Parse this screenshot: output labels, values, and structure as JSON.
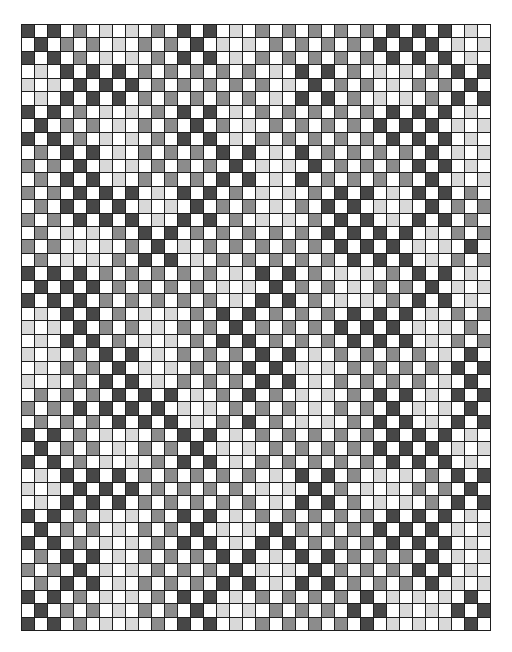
{
  "grid": {
    "columns": 36,
    "rows": 45,
    "palette": {
      "D": "#474747",
      "M": "#8c8c8c",
      "L": "#d9d9d9",
      "W": "#ffffff"
    },
    "border_color": "#1e1e1e",
    "cells": [
      "DWDWMWLWLWMWDWDWLWMWMWMWMWMWDWDWDWLW",
      "WDWMWMWLWMWMWDWLWLWMWMWMWMWDWDWDWLWL",
      "DWDWMWLWLWMWDWDWLWMWMWMWMWMWDWDWDWLW",
      "WLWDWDWDWMWMWMWMWMWLWDWDWMWLWLWMWDWD",
      "LWLWDWDWDWMWMWMWMWMWLWDWMWMWLWMWMWDW",
      "WLWDWDWDWMWMWMWMWMWLWDWDWMWLWLWMWDWD",
      "DWDWMWLWLWMWDWDWLWMWMWMWMWMWDWDWDWLW",
      "WDWMWMWLWMWMWDWMWLWMWMWMWMWDWDWDWLWL",
      "DWDWMWLWLWMWDWDWLWMWMWMWMWMWDWDWDWLW",
      "WMWDWDWLWMWMWMWDWDWLWDWMWMWMWMWDWLWL",
      "MWMWDWLWLWMWMWMWDWLWLWDWMWMWMWDWDWLW",
      "WMWDWDWLWMWMWMWDWDWLWDWMWMWMWMWDWLWL",
      "MWMWDWDWDWLWDWDWMWLWLWMWDWDWLWDWDWMW",
      "WMWDWDWDWLWLWDWMWMWLWMWDWDWLWLWDWMWM",
      "MWMWDWDWDWLWDWDWMWLWLWMWDWDWLWDWDWMW",
      "WMWLWLWMWDWDWMWMWMWMWMWDWDWDWDWLWMWM",
      "MWMWLWLWMWDWLWMWMWMWMWMWDWDWDWLWLWDW",
      "WMWLWLWMWDWDWLWMWMWMWMWMWDWDWDWLWMWM",
      "DWDWDWMWMWMWMWMWLWDWDWMWLWLWMWDWDWLW",
      "WDWDWDWMWMWMWMWLWLWDWMWMWLWMWMWDWLWL",
      "DWDWDWMWMWMWMWMWLWDWDWMWLWLWMWDWDWLW",
      "WLWDWDWMWLWLWMWDWDWMWMWMWDWDWDWLWMWM",
      "LWLWDWMWMWLWMWMWDWMWMWMWDWDWDWLWLWMW",
      "WLWDWDWMWLWLWMWDWDWMWMWMWDWDWDWLWMWM",
      "LWLWMWDWDWLWMWMWMWDWDWLWMWMWMWMWLWDW",
      "WLWMWMWDWLWLWMWMWDWDWLWLWMWMWMWMWDWD",
      "LWLWMWDWDWLWMWMWMWDWDWLWMWMWMWMWLWDW",
      "WMWMWMWDWDWDWLWMWDWMWLWLWMWDWDWLWDWD",
      "MWMWDWDWDWDWLWLWMWMWMWLWMWMWDWLWLWDW",
      "WMWMWMWDWDWDWLWMWDWMWLWLWMWDWDWLWDWD",
      "DWDWMWLWLWMWDWDWLWMWMWMWMWMWDWDWDWLW",
      "WDWMWMWLWMWMWDWLWLWMWMWMWMWDWDWDWLWL",
      "DWDWMWLWLWMWDWDWLWMWMWMWMWMWDWDWDWLW",
      "WLWDWDWDWMWMWMWMWMWLWDWDWMWLWLWMWDWD",
      "LWLWDWDWDWMWMWMWMWLWLWDWMWLWLWMWMWDW",
      "WLWDWDWDWMWMWMWMWMWLWDWDWMWLWLWMWDWD",
      "DWDWMWLWLWMWDWDWLWMWMWMWMWMWDWDWDWLW",
      "WDWMWMWLWMWMWDWLWLWDWMWMWMWDWDWDWLWL",
      "DWDWMWLWLWMWDWDWLWDWDWMWMWMWDWDWDWLW",
      "WMWDWDWLWMWMWMWDWDWLWDWDWMWMWMWDWLWL",
      "MWMWDWLWLWMWMWMWDWLWLWDWMWMWMWDWDWLW",
      "WMWDWDWLWMWMWMWDWDWLWDWDWMWMWMWDWLWL",
      "DWDWMWLWLWMWDWDWLWMWMWMWMWDWLWLWLWDW",
      "WDWMWMWLWMWMWDWLWLWMWMWMWDWDWLWLWDWD",
      "DWDWMWLWLWMWDWDWLWMWMWMWMWDWLWLWLWDW"
    ]
  }
}
